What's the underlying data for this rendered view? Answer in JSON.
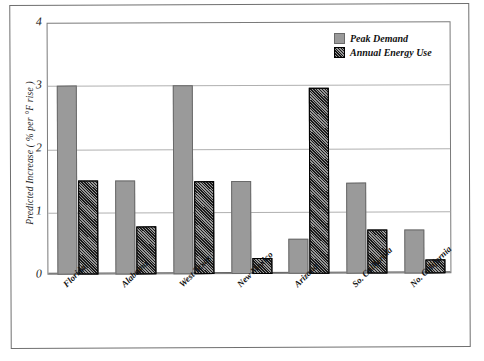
{
  "chart_data": {
    "type": "bar",
    "title": "",
    "subtitle": "",
    "xlabel": "",
    "ylabel": "Predicted Increase ( % per °F rise )",
    "ylim": [
      0,
      4
    ],
    "yticks": [
      0,
      1,
      2,
      3,
      4
    ],
    "ytick_labels": [
      "0",
      "1",
      "2",
      "3",
      "4"
    ],
    "grid": true,
    "grid_axis": "y",
    "legend_position": "top-right",
    "categories": [
      "Florida",
      "Alabama",
      "West Texas",
      "New Mexico",
      "Arizona",
      "So. California",
      "No. California"
    ],
    "series": [
      {
        "name": "Peak Demand",
        "color": "#9a9a9a",
        "pattern": "solid",
        "values": [
          3.0,
          1.5,
          3.0,
          1.47,
          0.55,
          1.44,
          0.7
        ]
      },
      {
        "name": "Annual Energy Use",
        "color": "#1a1a1a",
        "pattern": "diagonal-hatch",
        "values": [
          1.5,
          0.76,
          1.47,
          0.25,
          2.95,
          0.7,
          0.22
        ]
      }
    ],
    "annotations": []
  },
  "legend": {
    "items": [
      {
        "label": "Peak Demand",
        "swatch": "peak-demand-swatch"
      },
      {
        "label": "Annual Energy Use",
        "swatch": "annual-energy-use-swatch"
      }
    ]
  },
  "colors": {
    "peak_demand": "#9a9a9a",
    "annual_energy_use": "#1a1a1a",
    "gridline": "#b0b0b0",
    "frame": "#7a7a7a",
    "page_background": "#ffffff"
  }
}
